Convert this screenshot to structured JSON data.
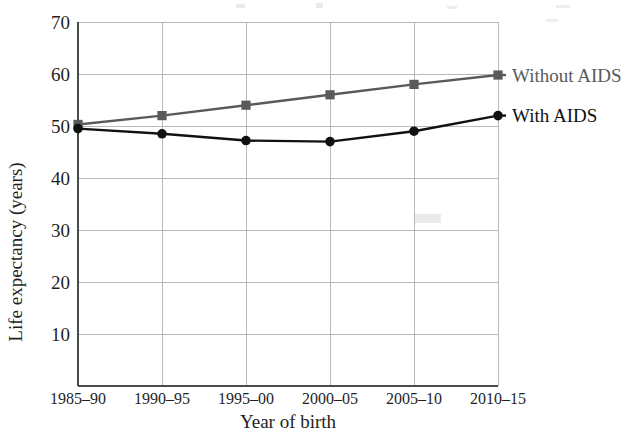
{
  "chart_data": {
    "type": "line",
    "title": "",
    "subtitle": "",
    "xlabel": "Year of birth",
    "ylabel": "Life expectancy (years)",
    "categories": [
      "1985–90",
      "1990–95",
      "1995–00",
      "2000–05",
      "2005–10",
      "2010–15"
    ],
    "ylim": [
      0,
      70
    ],
    "yticks": [
      10,
      20,
      30,
      40,
      50,
      60,
      70
    ],
    "ytick_labels": [
      "10",
      "20",
      "30",
      "40",
      "50",
      "60",
      "70"
    ],
    "grid": true,
    "legend_position": "right-inline",
    "series": [
      {
        "name": "Without AIDS",
        "color": "#5a5a5a",
        "marker": "square",
        "values": [
          50.3,
          52.0,
          54.0,
          56.0,
          58.0,
          59.8
        ]
      },
      {
        "name": "With AIDS",
        "color": "#111111",
        "marker": "circle",
        "values": [
          49.5,
          48.5,
          47.2,
          47.0,
          49.0,
          52.0
        ]
      }
    ]
  },
  "axes": {
    "y_axis_title": "Life expectancy (years)",
    "x_axis_title": "Year of birth",
    "y_tick_values": [
      "70",
      "60",
      "50",
      "40",
      "30",
      "20",
      "10"
    ],
    "x_tick_values": [
      "1985–90",
      "1990–95",
      "1995–00",
      "2000–05",
      "2005–10",
      "2010–15"
    ]
  },
  "legend": {
    "without_aids_label": "Without AIDS",
    "with_aids_label": "With AIDS"
  },
  "colors": {
    "without_aids": "#5a5a5a",
    "with_aids": "#111111",
    "grid": "#b9b9b9",
    "axis": "#4a4a4a",
    "background": "#ffffff"
  }
}
